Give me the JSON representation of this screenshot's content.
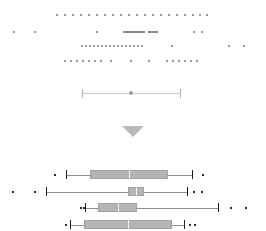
{
  "figure": {
    "title": "",
    "background_color": "#ffffff",
    "width": 266,
    "height": 231,
    "point_color": "#9a9a9a",
    "outlier_color": "#2b2b2b",
    "box_fill_color": "#b4b4b4",
    "box_edge_color": "#a2a2a2",
    "median_color": "#f2f2f2",
    "whisker_color": "#8e8e8e",
    "divider_color": "#b9b9b9"
  },
  "divider": {
    "icon": "triangle-down-icon",
    "label": ""
  },
  "interval_marker": {
    "label": "",
    "low": 82,
    "high": 180,
    "center": 131,
    "cap_color": "#b0b0b0",
    "line_color": "#c9c9c9",
    "dot_color": "#9e9e9e"
  },
  "chart_data": {
    "type": "boxplot",
    "title": "",
    "xlabel": "",
    "ylabel": "",
    "xlim": [
      0,
      266
    ],
    "grid": false,
    "legend": "none",
    "strip_rows": [
      {
        "name": "strip-row-1",
        "y": 14,
        "x": [
          56,
          64,
          72,
          80,
          88,
          96,
          104,
          112,
          120,
          128,
          136,
          144,
          152,
          160,
          168,
          176,
          184,
          192,
          199,
          206
        ],
        "dense_clusters": []
      },
      {
        "name": "strip-row-2",
        "y": 31,
        "x": [
          13,
          34,
          96
        ],
        "dense_clusters": [
          {
            "from": 123,
            "to": 143,
            "count": 22
          },
          {
            "from": 148,
            "to": 156,
            "count": 6
          }
        ],
        "extra": [
          193,
          201
        ]
      },
      {
        "name": "strip-row-3",
        "y": 45,
        "x": [
          81,
          85,
          89,
          93,
          97,
          101,
          105,
          109,
          113,
          117,
          121,
          125,
          129,
          133,
          137,
          141,
          171,
          228,
          243
        ]
      },
      {
        "name": "strip-row-4",
        "y": 60,
        "x": [
          64,
          70,
          76,
          82,
          88,
          94,
          100,
          110,
          130,
          148,
          166,
          172,
          178,
          184,
          190,
          196
        ]
      }
    ],
    "boxplots": [
      {
        "name": "boxplot-1",
        "y": 170,
        "whisker_low": 66,
        "q1": 90,
        "median": 129,
        "q3": 168,
        "whisker_high": 192,
        "outliers": [
          54,
          202
        ]
      },
      {
        "name": "boxplot-2",
        "y": 187,
        "whisker_low": 46,
        "q1": 128,
        "median": 136,
        "q3": 144,
        "whisker_high": 187,
        "outliers": [
          12,
          34,
          193,
          201
        ]
      },
      {
        "name": "boxplot-3",
        "y": 203,
        "whisker_low": 85,
        "q1": 98,
        "median": 118,
        "q3": 137,
        "whisker_high": 218,
        "outliers": [
          80,
          83,
          230,
          245
        ]
      },
      {
        "name": "boxplot-4",
        "y": 220,
        "whisker_low": 70,
        "q1": 84,
        "median": 128,
        "q3": 172,
        "whisker_high": 184,
        "outliers": [
          65,
          189,
          194
        ]
      }
    ]
  }
}
